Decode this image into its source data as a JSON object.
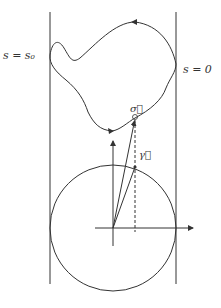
{
  "figure": {
    "labels": {
      "s_eq_s0": "s = s₀",
      "s_eq_0": "s = 0",
      "sigma": "σ⃗",
      "gamma": "γ⃗"
    },
    "colors": {
      "stroke": "#333333",
      "background": "#ffffff"
    },
    "elements": [
      "left-boundary-line",
      "right-boundary-line",
      "closed-curve",
      "unit-circle",
      "horizontal-axis",
      "vertical-axis",
      "sigma-vector",
      "gamma-vector",
      "dashed-projection"
    ]
  }
}
